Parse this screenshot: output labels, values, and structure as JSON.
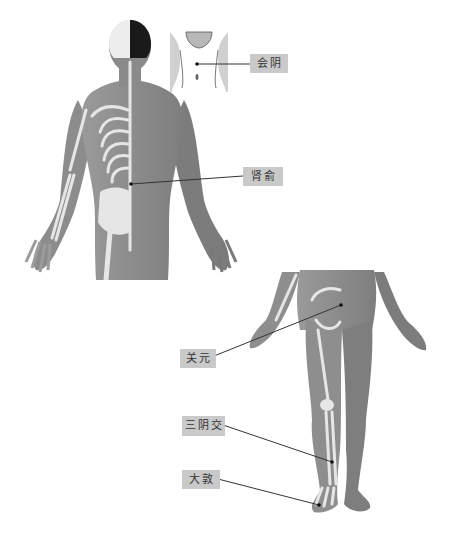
{
  "diagram": {
    "type": "acupuncture-points",
    "figures": [
      {
        "id": "back-view",
        "description": "Human figure, posterior view, half skeleton"
      },
      {
        "id": "perineum-inset",
        "description": "Perineal region inset"
      },
      {
        "id": "front-view",
        "description": "Human lower body, anterior view, half skeleton"
      }
    ],
    "points": [
      {
        "name": "会阴",
        "label_box": {
          "x": 250,
          "y": 54,
          "w": 36,
          "h": 19
        },
        "dot": {
          "x": 197,
          "y": 64
        },
        "line_from": {
          "x": 250,
          "y": 64
        }
      },
      {
        "name": "肾俞",
        "label_box": {
          "x": 243,
          "y": 167,
          "w": 38,
          "h": 19
        },
        "dot": {
          "x": 131,
          "y": 184
        },
        "line_from": {
          "x": 243,
          "y": 176
        }
      },
      {
        "name": "关元",
        "label_box": {
          "x": 180,
          "y": 349,
          "w": 34,
          "h": 19
        },
        "dot": {
          "x": 341,
          "y": 305
        },
        "line_from": {
          "x": 214,
          "y": 356
        }
      },
      {
        "name": "三阴交",
        "label_box": {
          "x": 182,
          "y": 416,
          "w": 41,
          "h": 20
        },
        "dot": {
          "x": 332,
          "y": 462
        },
        "line_from": {
          "x": 223,
          "y": 425
        }
      },
      {
        "name": "大敦",
        "label_box": {
          "x": 182,
          "y": 470,
          "w": 36,
          "h": 19
        },
        "dot": {
          "x": 319,
          "y": 505
        },
        "line_from": {
          "x": 218,
          "y": 479
        }
      }
    ],
    "colors": {
      "label_bg": "#c9c9c9",
      "label_text": "#333333",
      "skin": "#8a8a8a",
      "skin_dark": "#7a7a7a",
      "bone": "#e6e6e6",
      "line": "#333333",
      "hair": "#1a1a1a"
    }
  }
}
